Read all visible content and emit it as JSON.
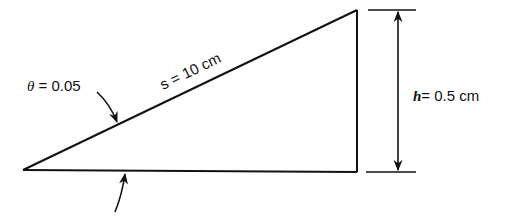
{
  "diagram": {
    "theta_label": {
      "symbol": "θ",
      "text": " = 0.05"
    },
    "slope_label": {
      "symbol": "s",
      "text": " = 10 cm"
    },
    "height_label": {
      "symbol": "h",
      "text": "= 0.5 cm"
    },
    "colors": {
      "stroke": "#111111",
      "background": "#ffffff"
    }
  }
}
